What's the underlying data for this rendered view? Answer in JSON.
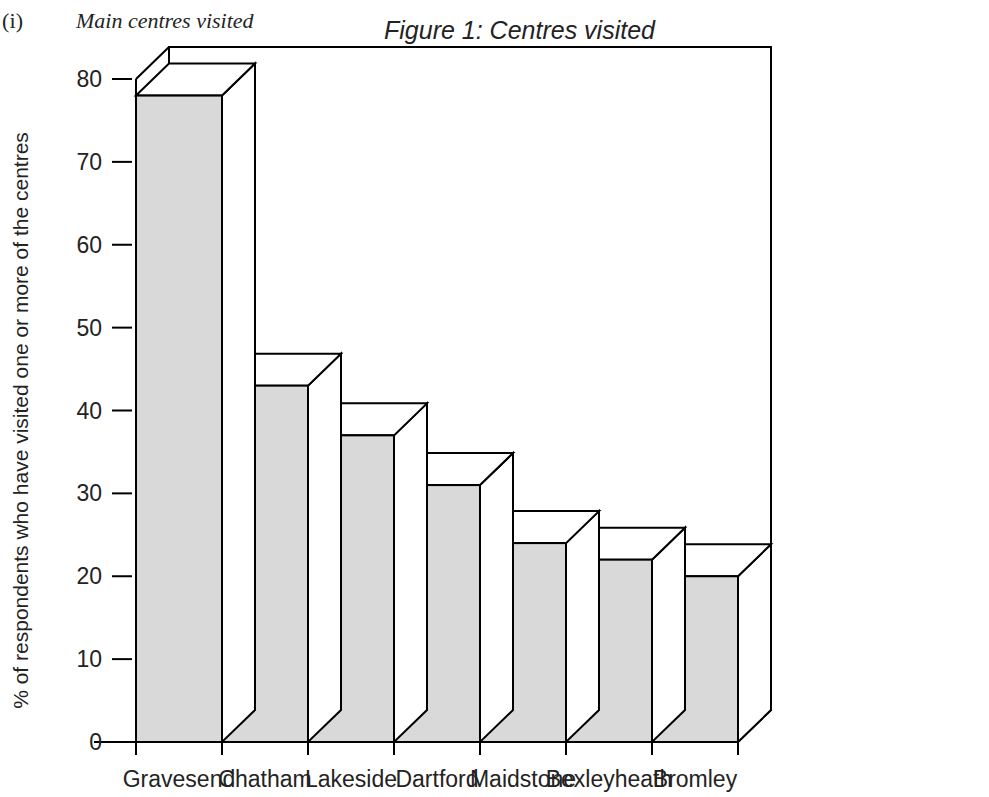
{
  "header": {
    "numeral": "(i)",
    "subtitle": "Main centres visited"
  },
  "chart_data": {
    "type": "bar",
    "title": "Figure 1: Centres visited",
    "xlabel": "",
    "ylabel": "% of respondents who have visited one or more of the centres",
    "categories": [
      "Gravesend",
      "Chatham",
      "Lakeside",
      "Dartford",
      "Maidstone",
      "Bexleyheath",
      "Bromley"
    ],
    "values": [
      78,
      43,
      37,
      31,
      24,
      22,
      20
    ],
    "ylim": [
      0,
      80
    ],
    "yticks": [
      0,
      10,
      20,
      30,
      40,
      50,
      60,
      70,
      80
    ],
    "ytick_labels": [
      "0",
      "10",
      "20",
      "30",
      "40",
      "50",
      "60",
      "70",
      "80"
    ],
    "grid": false,
    "legend": false,
    "style": "3d-columns",
    "bar_fill_color": "#d9d9d9",
    "bar_top_color": "#ffffff",
    "bar_side_color": "#ffffff",
    "bar_edge_color": "#000000",
    "axis_color": "#000000",
    "background_color": "#ffffff"
  }
}
